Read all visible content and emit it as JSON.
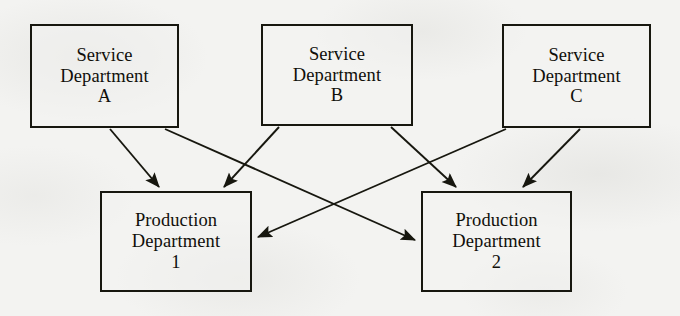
{
  "diagram": {
    "type": "cost-allocation-flow",
    "background_color": "#f3f3f1",
    "line_color": "#17170f",
    "nodes": [
      {
        "id": "service-a",
        "role": "service-department",
        "line1": "Service",
        "line2": "Department",
        "line3": "A",
        "x": 30,
        "y": 24,
        "w": 149,
        "h": 104
      },
      {
        "id": "service-b",
        "role": "service-department",
        "line1": "Service",
        "line2": "Department",
        "line3": "B",
        "x": 261,
        "y": 24,
        "w": 152,
        "h": 102
      },
      {
        "id": "service-c",
        "role": "service-department",
        "line1": "Service",
        "line2": "Department",
        "line3": "C",
        "x": 502,
        "y": 24,
        "w": 149,
        "h": 104
      },
      {
        "id": "production-1",
        "role": "production-department",
        "line1": "Production",
        "line2": "Department",
        "line3": "1",
        "x": 100,
        "y": 191,
        "w": 152,
        "h": 101
      },
      {
        "id": "production-2",
        "role": "production-department",
        "line1": "Production",
        "line2": "Department",
        "line3": "2",
        "x": 421,
        "y": 191,
        "w": 151,
        "h": 101
      }
    ],
    "edges": [
      {
        "id": "edge-a-to-prod1",
        "from": "service-a",
        "to": "production-1",
        "x1": 110,
        "y1": 129,
        "x2": 159,
        "y2": 189
      },
      {
        "id": "edge-a-to-prod2",
        "from": "service-a",
        "to": "production-2",
        "x1": 165,
        "y1": 129,
        "x2": 418,
        "y2": 241
      },
      {
        "id": "edge-b-to-prod1",
        "from": "service-b",
        "to": "production-1",
        "x1": 279,
        "y1": 127,
        "x2": 223,
        "y2": 189
      },
      {
        "id": "edge-b-to-prod2",
        "from": "service-b",
        "to": "production-2",
        "x1": 391,
        "y1": 127,
        "x2": 456,
        "y2": 189
      },
      {
        "id": "edge-c-to-prod1",
        "from": "service-c",
        "to": "production-1",
        "x1": 506,
        "y1": 129,
        "x2": 256,
        "y2": 238
      },
      {
        "id": "edge-c-to-prod2",
        "from": "service-c",
        "to": "production-2",
        "x1": 580,
        "y1": 129,
        "x2": 522,
        "y2": 189
      }
    ]
  }
}
